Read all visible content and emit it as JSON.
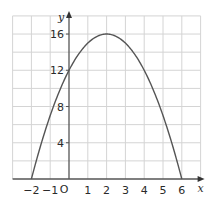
{
  "chart_data": {
    "type": "line",
    "title": "",
    "xlabel": "x",
    "ylabel": "y",
    "origin_label": "O",
    "function": "y = -x^2 + 4x + 12",
    "xlim": [
      -3,
      7
    ],
    "ylim": [
      0,
      18
    ],
    "grid": true,
    "grid_x_step": 1,
    "grid_y_step": 2,
    "x_ticks": [
      -2,
      -1,
      1,
      2,
      3,
      4,
      5,
      6
    ],
    "x_tick_labels": [
      "−2",
      "−1",
      "1",
      "2",
      "3",
      "4",
      "5",
      "6"
    ],
    "y_ticks": [
      4,
      8,
      12,
      16
    ],
    "y_tick_labels": [
      "4",
      "8",
      "12",
      "16"
    ],
    "series": [
      {
        "name": "parabola",
        "x": [
          -2,
          -1,
          0,
          1,
          2,
          3,
          4,
          5,
          6
        ],
        "y": [
          0,
          7,
          12,
          15,
          16,
          15,
          12,
          7,
          0
        ]
      }
    ],
    "key_points": {
      "roots": [
        -2,
        6
      ],
      "vertex": [
        2,
        16
      ],
      "y_intercept": 12
    },
    "colors": {
      "curve": "#555555",
      "grid": "#d4d4d4",
      "axis": "#555555"
    }
  }
}
